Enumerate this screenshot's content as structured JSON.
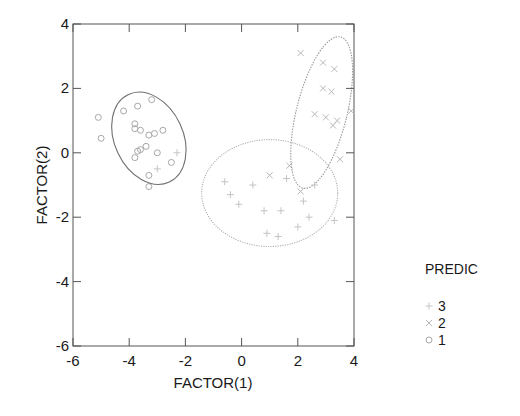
{
  "chart_data": {
    "type": "scatter",
    "title": "",
    "xlabel": "FACTOR(1)",
    "ylabel": "FACTOR(2)",
    "xlim": [
      -6,
      4
    ],
    "ylim": [
      -6,
      4
    ],
    "xticks": [
      -6,
      -4,
      -2,
      0,
      2,
      4
    ],
    "yticks": [
      -6,
      -4,
      -2,
      0,
      2,
      4
    ],
    "grid": false,
    "legend": {
      "title": "PREDIC",
      "position": "right",
      "entries": [
        {
          "label": "3",
          "marker": "plus"
        },
        {
          "label": "2",
          "marker": "cross"
        },
        {
          "label": "1",
          "marker": "circle"
        }
      ]
    },
    "series": [
      {
        "name": "1",
        "marker": "circle",
        "color": "#a8a8a8",
        "points": [
          [
            -5.1,
            1.1
          ],
          [
            -5.0,
            0.45
          ],
          [
            -4.2,
            1.3
          ],
          [
            -3.7,
            1.45
          ],
          [
            -3.2,
            1.65
          ],
          [
            -3.8,
            0.9
          ],
          [
            -3.8,
            0.75
          ],
          [
            -3.6,
            0.7
          ],
          [
            -3.1,
            0.6
          ],
          [
            -3.3,
            0.55
          ],
          [
            -2.8,
            0.7
          ],
          [
            -3.4,
            0.2
          ],
          [
            -3.6,
            0.1
          ],
          [
            -3.8,
            -0.15
          ],
          [
            -3.0,
            0.0
          ],
          [
            -2.5,
            -0.3
          ],
          [
            -3.3,
            -0.7
          ],
          [
            -3.3,
            -1.05
          ],
          [
            -3.7,
            0.05
          ]
        ],
        "ellipse": {
          "cx": -3.3,
          "cy": 0.45,
          "rx": 1.22,
          "ry": 1.5,
          "angle": -25,
          "color": "#707070",
          "dash": ""
        }
      },
      {
        "name": "2",
        "marker": "cross",
        "color": "#b8b8b8",
        "points": [
          [
            2.1,
            3.1
          ],
          [
            2.9,
            2.8
          ],
          [
            3.3,
            2.6
          ],
          [
            2.9,
            2.0
          ],
          [
            3.2,
            1.9
          ],
          [
            2.6,
            1.2
          ],
          [
            3.0,
            1.1
          ],
          [
            3.4,
            1.0
          ],
          [
            3.25,
            0.85
          ],
          [
            3.9,
            1.3
          ],
          [
            1.0,
            -0.7
          ],
          [
            1.7,
            -0.4
          ],
          [
            2.1,
            -1.2
          ],
          [
            3.5,
            -0.2
          ]
        ],
        "ellipse": {
          "cx": 2.85,
          "cy": 1.25,
          "rx": 0.9,
          "ry": 2.42,
          "angle": 14,
          "color": "#9a9a9a",
          "dash": "1.5,1.2"
        }
      },
      {
        "name": "3",
        "marker": "plus",
        "color": "#c4c4c4",
        "points": [
          [
            -0.6,
            -0.9
          ],
          [
            -0.4,
            -1.3
          ],
          [
            -0.1,
            -1.6
          ],
          [
            0.8,
            -1.8
          ],
          [
            1.4,
            -1.8
          ],
          [
            2.2,
            -1.5
          ],
          [
            2.6,
            -1.0
          ],
          [
            2.4,
            -2.0
          ],
          [
            0.9,
            -2.5
          ],
          [
            1.3,
            -2.6
          ],
          [
            -2.3,
            0.0
          ],
          [
            -3.0,
            -0.5
          ],
          [
            1.6,
            -0.8
          ],
          [
            3.3,
            -2.1
          ],
          [
            0.4,
            -1.0
          ],
          [
            2.0,
            -2.3
          ]
        ],
        "ellipse": {
          "cx": 1.0,
          "cy": -1.25,
          "rx": 2.42,
          "ry": 1.66,
          "angle": 0,
          "color": "#b0b0b0",
          "dash": "1.2,1.2"
        }
      }
    ]
  },
  "axes": {
    "x_title": "FACTOR(1)",
    "y_title": "FACTOR(2)"
  },
  "legend": {
    "title": "PREDIC",
    "items": [
      {
        "label": "3"
      },
      {
        "label": "2"
      },
      {
        "label": "1"
      }
    ]
  }
}
